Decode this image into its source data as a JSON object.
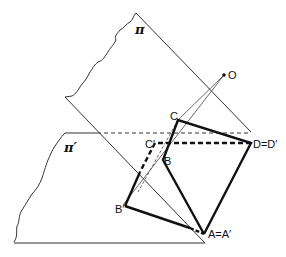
{
  "diagram": {
    "planes": [
      {
        "id": "pi",
        "label": "π"
      },
      {
        "id": "pi_prime",
        "label": "π′"
      }
    ],
    "points": {
      "O": "O",
      "C": "C",
      "C_prime": "C′",
      "B": "B",
      "B_prime": "B′",
      "D": "D=D′",
      "A": "A=A′"
    },
    "colors": {
      "line": "#222222",
      "thin": "#444444"
    }
  }
}
